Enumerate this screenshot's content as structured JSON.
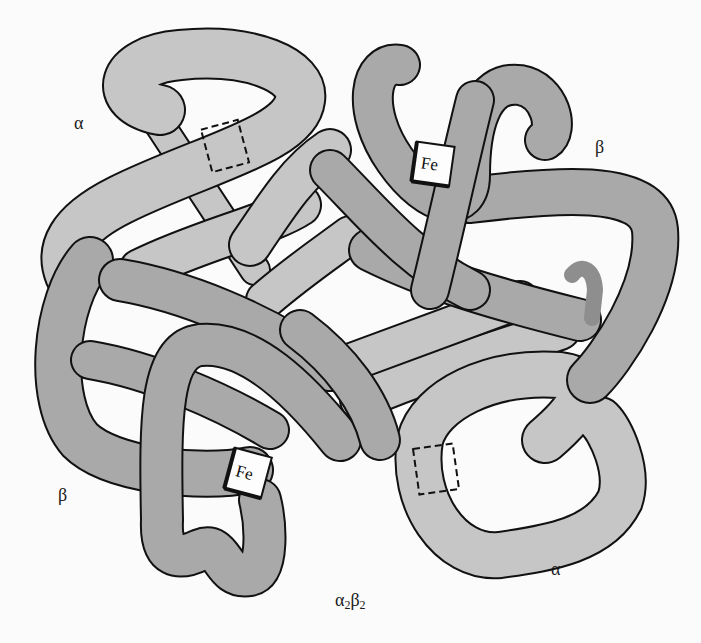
{
  "diagram": {
    "subunit_formula": {
      "alpha": "α",
      "alpha_sub": "2",
      "beta": "β",
      "beta_sub": "2"
    },
    "chain_labels": {
      "alpha_top_left": "α",
      "beta_top_right": "β",
      "beta_bottom_left": "β",
      "alpha_bottom_right": "α"
    },
    "heme_labels": {
      "beta_top": "Fe",
      "beta_bottom": "Fe"
    },
    "colors": {
      "alpha_chain": "#c6c6c6",
      "beta_chain": "#a9a9a9",
      "beta_dark_tip": "#8e8e8e",
      "outline": "#111111",
      "heme_box": "#fdfdfd",
      "background": "#fbfbfb"
    }
  }
}
